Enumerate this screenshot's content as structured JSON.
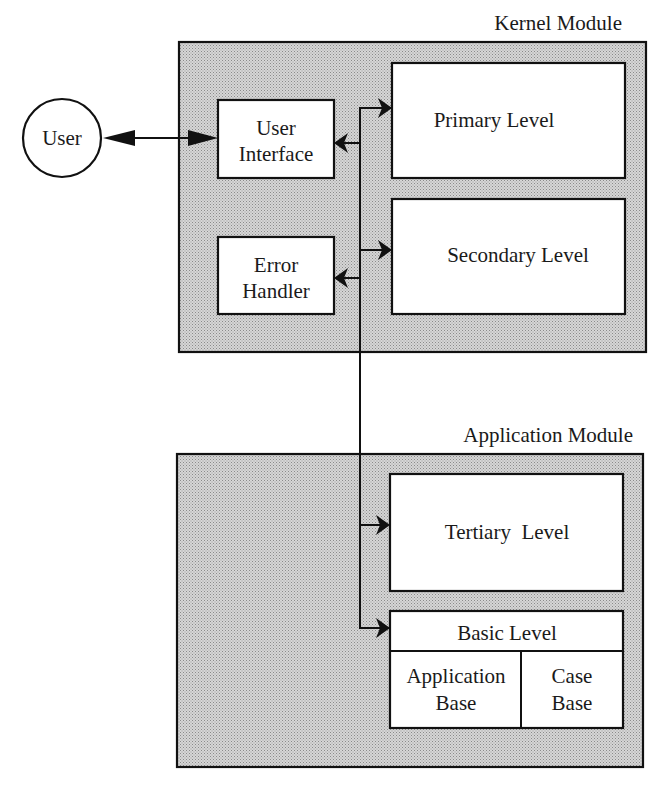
{
  "diagram": {
    "type": "architecture-block-diagram",
    "external_actor": {
      "label": "User"
    },
    "modules": [
      {
        "id": "kernel",
        "title": "Kernel Module",
        "components": [
          {
            "id": "user_interface",
            "lines": [
              "User",
              "Interface"
            ]
          },
          {
            "id": "error_handler",
            "lines": [
              "Error",
              "Handler"
            ]
          },
          {
            "id": "primary_level",
            "label": "Primary Level"
          },
          {
            "id": "secondary_level",
            "label": "Secondary Level"
          }
        ]
      },
      {
        "id": "application",
        "title": "Application Module",
        "components": [
          {
            "id": "tertiary_level",
            "label": "Tertiary  Level"
          },
          {
            "id": "basic_level",
            "label": "Basic Level",
            "subparts": [
              {
                "id": "application_base",
                "lines": [
                  "Application",
                  "Base"
                ]
              },
              {
                "id": "case_base",
                "lines": [
                  "Case",
                  "Base"
                ]
              }
            ]
          }
        ]
      }
    ],
    "connections": [
      {
        "from": "User",
        "to": "User Interface",
        "direction": "bidirectional"
      },
      {
        "from": "bus",
        "to": "User Interface",
        "direction": "to"
      },
      {
        "from": "bus",
        "to": "Primary Level",
        "direction": "to"
      },
      {
        "from": "bus",
        "to": "Secondary Level",
        "direction": "to"
      },
      {
        "from": "bus",
        "to": "Error Handler",
        "direction": "to"
      },
      {
        "from": "bus",
        "to": "Tertiary Level",
        "direction": "to"
      },
      {
        "from": "bus",
        "to": "Basic Level",
        "direction": "to"
      }
    ],
    "colors": {
      "line": "#111111",
      "module_fill": "#c8c8c8",
      "box_fill": "#ffffff"
    }
  }
}
